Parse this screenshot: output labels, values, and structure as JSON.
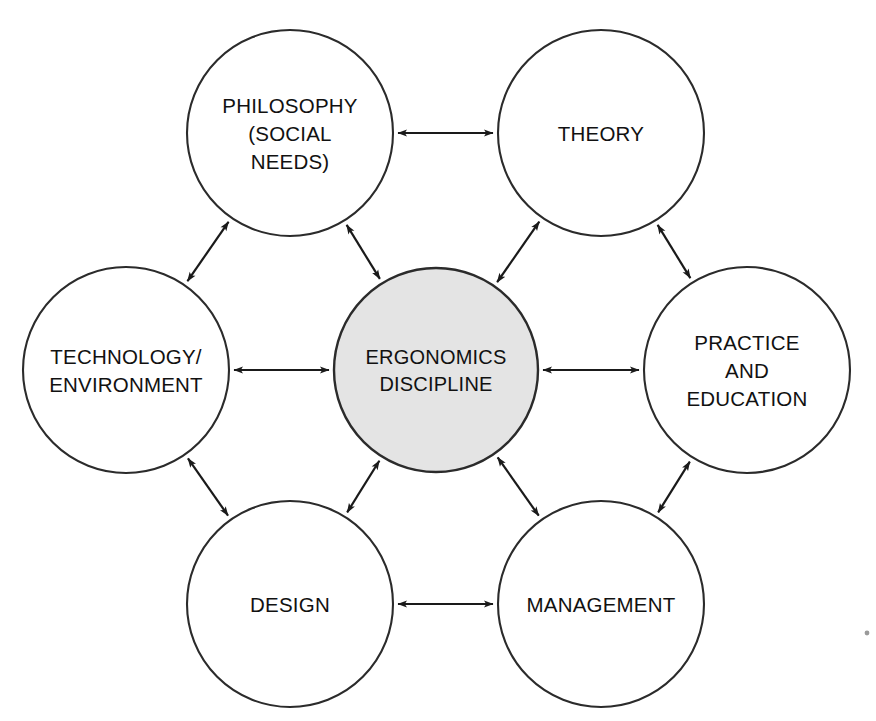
{
  "diagram": {
    "background_color": "#ffffff",
    "stroke_color": "#1a1a1a",
    "center_fill_color": "#e4e4e4",
    "node_fill_color": "#ffffff",
    "nodes": [
      {
        "id": "philosophy",
        "lines": [
          "PHILOSOPHY",
          "(SOCIAL",
          "NEEDS)"
        ],
        "cx": 290,
        "cy": 133,
        "r": 103,
        "is_center": false
      },
      {
        "id": "theory",
        "lines": [
          "THEORY"
        ],
        "cx": 601,
        "cy": 133,
        "r": 103,
        "is_center": false
      },
      {
        "id": "technology-environment",
        "lines": [
          "TECHNOLOGY/",
          "ENVIRONMENT"
        ],
        "cx": 126,
        "cy": 370,
        "r": 103,
        "is_center": false
      },
      {
        "id": "ergonomics-discipline",
        "lines": [
          "ERGONOMICS",
          "DISCIPLINE"
        ],
        "cx": 436,
        "cy": 370,
        "r": 102,
        "is_center": true
      },
      {
        "id": "practice-and-education",
        "lines": [
          "PRACTICE",
          "AND",
          "EDUCATION"
        ],
        "cx": 747,
        "cy": 370,
        "r": 103,
        "is_center": false
      },
      {
        "id": "design",
        "lines": [
          "DESIGN"
        ],
        "cx": 290,
        "cy": 604,
        "r": 103,
        "is_center": false
      },
      {
        "id": "management",
        "lines": [
          "MANAGEMENT"
        ],
        "cx": 601,
        "cy": 604,
        "r": 103,
        "is_center": false
      }
    ],
    "links": [
      {
        "id": "philosophy-theory",
        "from": "philosophy",
        "to": "theory",
        "arrows": "both"
      },
      {
        "id": "philosophy-ergonomics",
        "from": "philosophy",
        "to": "ergonomics-discipline",
        "arrows": "both"
      },
      {
        "id": "theory-ergonomics",
        "from": "theory",
        "to": "ergonomics-discipline",
        "arrows": "both"
      },
      {
        "id": "philosophy-technology",
        "from": "philosophy",
        "to": "technology-environment",
        "arrows": "both"
      },
      {
        "id": "theory-practice",
        "from": "theory",
        "to": "practice-and-education",
        "arrows": "both"
      },
      {
        "id": "technology-ergonomics",
        "from": "technology-environment",
        "to": "ergonomics-discipline",
        "arrows": "both"
      },
      {
        "id": "ergonomics-practice",
        "from": "ergonomics-discipline",
        "to": "practice-and-education",
        "arrows": "both"
      },
      {
        "id": "technology-design",
        "from": "technology-environment",
        "to": "design",
        "arrows": "both"
      },
      {
        "id": "practice-management",
        "from": "practice-and-education",
        "to": "management",
        "arrows": "both"
      },
      {
        "id": "design-ergonomics",
        "from": "design",
        "to": "ergonomics-discipline",
        "arrows": "both"
      },
      {
        "id": "management-ergonomics",
        "from": "management",
        "to": "ergonomics-discipline",
        "arrows": "both"
      },
      {
        "id": "design-management",
        "from": "design",
        "to": "management",
        "arrows": "both"
      }
    ],
    "artifacts": [
      {
        "id": "corner-speck",
        "cx": 867,
        "cy": 633,
        "r": 2.4
      }
    ]
  }
}
